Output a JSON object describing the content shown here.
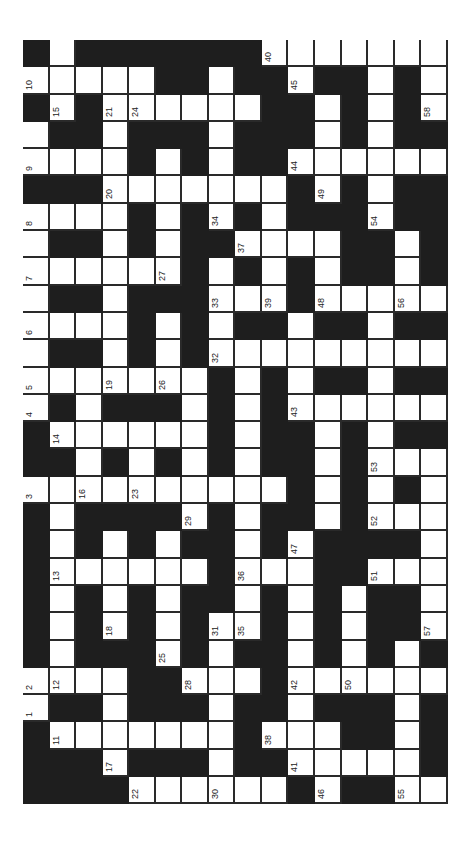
{
  "puzzle": {
    "orientation": "rotated-90-ccw",
    "columns": 16,
    "rows_count": 28,
    "colors": {
      "block": "#1e1e1e",
      "cell": "#ffffff",
      "line": "#2a2a2a"
    },
    "legend": "B = black block, W = white cell, Wn = white cell with clue number n",
    "rows": [
      [
        "B",
        "W",
        "B",
        "B",
        "B",
        "B",
        "B",
        "B",
        "B",
        "W40",
        "W",
        "W",
        "W",
        "W",
        "W",
        "W"
      ],
      [
        "W10",
        "W",
        "W",
        "W",
        "W",
        "B",
        "B",
        "W",
        "B",
        "B",
        "W45",
        "B",
        "B",
        "W",
        "B",
        "W"
      ],
      [
        "B",
        "W15",
        "B",
        "W21",
        "W24",
        "W",
        "W",
        "W",
        "W",
        "B",
        "B",
        "W",
        "B",
        "W",
        "B",
        "W58"
      ],
      [
        "W",
        "B",
        "B",
        "W",
        "B",
        "B",
        "B",
        "W",
        "B",
        "B",
        "B",
        "W",
        "B",
        "W",
        "B",
        "B"
      ],
      [
        "W9",
        "W",
        "W",
        "W",
        "B",
        "W",
        "B",
        "W",
        "B",
        "B",
        "W44",
        "W",
        "W",
        "W",
        "W",
        "W"
      ],
      [
        "B",
        "B",
        "B",
        "W20",
        "W",
        "W",
        "W",
        "W",
        "W",
        "W",
        "B",
        "W49",
        "B",
        "W",
        "B",
        "B"
      ],
      [
        "W8",
        "W",
        "W",
        "W",
        "B",
        "W",
        "B",
        "W34",
        "B",
        "W",
        "B",
        "B",
        "B",
        "W54",
        "B",
        "B"
      ],
      [
        "W",
        "B",
        "B",
        "W",
        "B",
        "W",
        "B",
        "B",
        "W37",
        "W",
        "W",
        "W",
        "B",
        "B",
        "W",
        "B"
      ],
      [
        "W7",
        "W",
        "W",
        "W",
        "W",
        "W27",
        "B",
        "W",
        "B",
        "W",
        "B",
        "W",
        "B",
        "B",
        "W",
        "B"
      ],
      [
        "W",
        "B",
        "B",
        "W",
        "B",
        "B",
        "B",
        "W33",
        "W",
        "W39",
        "B",
        "W48",
        "W",
        "W",
        "W56",
        "W"
      ],
      [
        "W6",
        "W",
        "W",
        "W",
        "B",
        "W",
        "B",
        "W",
        "B",
        "B",
        "W",
        "B",
        "B",
        "W",
        "B",
        "B"
      ],
      [
        "W",
        "B",
        "B",
        "W",
        "B",
        "W",
        "B",
        "W32",
        "W",
        "W",
        "W",
        "W",
        "W",
        "W",
        "W",
        "W"
      ],
      [
        "W5",
        "W",
        "W",
        "W19",
        "W",
        "W26",
        "W",
        "B",
        "W",
        "B",
        "W",
        "B",
        "B",
        "W",
        "B",
        "B"
      ],
      [
        "W4",
        "B",
        "W",
        "B",
        "B",
        "B",
        "W",
        "B",
        "W",
        "B",
        "W43",
        "W",
        "W",
        "W",
        "W",
        "W"
      ],
      [
        "B",
        "W14",
        "W",
        "W",
        "W",
        "W",
        "W",
        "B",
        "W",
        "B",
        "B",
        "W",
        "B",
        "W",
        "B",
        "B"
      ],
      [
        "B",
        "B",
        "W",
        "B",
        "W",
        "B",
        "W",
        "B",
        "W",
        "B",
        "B",
        "W",
        "B",
        "W53",
        "W",
        "W"
      ],
      [
        "W3",
        "W",
        "W16",
        "W",
        "W23",
        "W",
        "W",
        "W",
        "W",
        "W",
        "B",
        "W",
        "B",
        "W",
        "B",
        "W"
      ],
      [
        "B",
        "W",
        "B",
        "B",
        "B",
        "B",
        "W29",
        "B",
        "W",
        "B",
        "B",
        "W",
        "B",
        "W52",
        "W",
        "W"
      ],
      [
        "B",
        "W",
        "B",
        "W",
        "B",
        "W",
        "B",
        "B",
        "W",
        "B",
        "W47",
        "B",
        "B",
        "B",
        "B",
        "W"
      ],
      [
        "B",
        "W13",
        "W",
        "W",
        "W",
        "W",
        "W",
        "B",
        "W36",
        "W",
        "W",
        "B",
        "B",
        "W51",
        "W",
        "W"
      ],
      [
        "B",
        "W",
        "B",
        "W",
        "B",
        "W",
        "B",
        "B",
        "W",
        "B",
        "W",
        "B",
        "W",
        "B",
        "B",
        "W"
      ],
      [
        "B",
        "W",
        "B",
        "W18",
        "B",
        "W",
        "B",
        "W31",
        "W35",
        "B",
        "W",
        "B",
        "W",
        "B",
        "B",
        "W57"
      ],
      [
        "B",
        "W",
        "B",
        "B",
        "B",
        "W25",
        "B",
        "W",
        "B",
        "B",
        "W",
        "B",
        "W",
        "B",
        "W",
        "B"
      ],
      [
        "W2",
        "W12",
        "W",
        "W",
        "B",
        "B",
        "W28",
        "W",
        "W",
        "B",
        "W42",
        "W",
        "W50",
        "W",
        "W",
        "W"
      ],
      [
        "W1",
        "B",
        "B",
        "W",
        "B",
        "B",
        "B",
        "W",
        "B",
        "B",
        "W",
        "B",
        "B",
        "B",
        "W",
        "B"
      ],
      [
        "B",
        "W11",
        "W",
        "W",
        "W",
        "W",
        "W",
        "W",
        "B",
        "W38",
        "W",
        "W",
        "B",
        "B",
        "W",
        "B"
      ],
      [
        "B",
        "B",
        "B",
        "W17",
        "B",
        "B",
        "B",
        "W",
        "B",
        "B",
        "W41",
        "W",
        "W",
        "W",
        "W",
        "B"
      ],
      [
        "B",
        "B",
        "B",
        "B",
        "W22",
        "W",
        "W",
        "W30",
        "W",
        "W",
        "B",
        "W46",
        "B",
        "B",
        "W55",
        "W"
      ]
    ]
  }
}
